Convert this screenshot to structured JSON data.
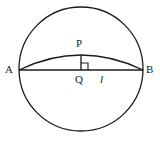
{
  "figure": {
    "background_color": "#ffffff",
    "stroke_color": "#1a1a1a",
    "stroke_width": 1.2
  },
  "labels": {
    "a": "A",
    "b": "B",
    "p": "P",
    "q": "Q",
    "length": "l"
  },
  "geometry": {
    "circle": {
      "cx": 81,
      "cy": 69,
      "r": 62
    },
    "chord_ab": {
      "x1": 19,
      "y1": 70,
      "x2": 143,
      "y2": 70
    },
    "arc_apb": {
      "start_x": 19,
      "start_y": 70,
      "end_x": 143,
      "end_y": 70,
      "apex_x": 81,
      "apex_y": 55
    },
    "segment_pq": {
      "x1": 81,
      "y1": 55,
      "x2": 81,
      "y2": 70
    },
    "right_angle_marker": {
      "x": 81,
      "y": 70,
      "size": 7
    }
  }
}
